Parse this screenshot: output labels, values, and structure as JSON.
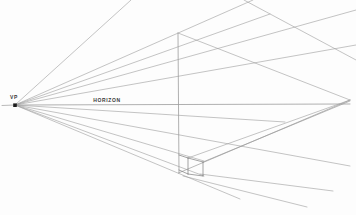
{
  "figure": {
    "background": "#fdfdfd",
    "line_color": "#9c9c9c",
    "box_line_color": "#7d7d7d",
    "text_color": "#3a3a3a",
    "marker_color": "#1c1c1c",
    "width": 356,
    "height": 215,
    "labels": {
      "vp": "VP",
      "horizon": "HORIZON"
    },
    "vanishing_point_marker": {
      "x": 13.2,
      "y": 103.4,
      "size": 3.6
    },
    "left_vp": {
      "x": 15,
      "y": 105
    },
    "right_vp": {
      "x": 350,
      "y": 100
    },
    "lines": [
      {
        "x1": 2,
        "y1": 105.5,
        "x2": 15,
        "y2": 105,
        "w": 0.7
      },
      {
        "x1": 15,
        "y1": 105,
        "x2": 350,
        "y2": 104,
        "w": 0.8
      },
      {
        "x1": 15,
        "y1": 105,
        "x2": 131,
        "y2": 0,
        "w": 0.6
      },
      {
        "x1": 15,
        "y1": 105,
        "x2": 253,
        "y2": 0,
        "w": 0.6
      },
      {
        "x1": 15,
        "y1": 105,
        "x2": 270,
        "y2": 14,
        "w": 0.6
      },
      {
        "x1": 15,
        "y1": 105,
        "x2": 356,
        "y2": 10,
        "w": 0.6
      },
      {
        "x1": 15,
        "y1": 105,
        "x2": 356,
        "y2": 45,
        "w": 0.6
      },
      {
        "x1": 15,
        "y1": 105,
        "x2": 285,
        "y2": 122,
        "w": 0.6
      },
      {
        "x1": 15,
        "y1": 105,
        "x2": 350,
        "y2": 166,
        "w": 0.6
      },
      {
        "x1": 15,
        "y1": 105,
        "x2": 204,
        "y2": 161,
        "w": 0.6
      },
      {
        "x1": 15,
        "y1": 105,
        "x2": 204,
        "y2": 176,
        "w": 0.6
      },
      {
        "x1": 15,
        "y1": 105,
        "x2": 240,
        "y2": 199,
        "w": 0.6
      },
      {
        "x1": 178,
        "y1": 33,
        "x2": 179,
        "y2": 173,
        "w": 0.8
      },
      {
        "x1": 178,
        "y1": 33,
        "x2": 350,
        "y2": 100,
        "w": 0.6
      },
      {
        "x1": 178.5,
        "y1": 173,
        "x2": 350,
        "y2": 100,
        "w": 0.7
      },
      {
        "x1": 188,
        "y1": 158,
        "x2": 350,
        "y2": 100,
        "w": 0.6
      },
      {
        "x1": 203,
        "y1": 162,
        "x2": 350,
        "y2": 101,
        "w": 0.7
      },
      {
        "x1": 244,
        "y1": 0,
        "x2": 356,
        "y2": 60,
        "w": 0.6
      },
      {
        "x1": 200,
        "y1": 174,
        "x2": 333,
        "y2": 191,
        "w": 0.6
      },
      {
        "x1": 183,
        "y1": 176,
        "x2": 307,
        "y2": 207,
        "w": 0.6
      }
    ],
    "small_box_edges": [
      {
        "x1": 179,
        "y1": 155,
        "x2": 188,
        "y2": 158
      },
      {
        "x1": 188,
        "y1": 158,
        "x2": 203,
        "y2": 162
      },
      {
        "x1": 188,
        "y1": 158,
        "x2": 188,
        "y2": 174
      },
      {
        "x1": 203,
        "y1": 162,
        "x2": 203,
        "y2": 176
      },
      {
        "x1": 188,
        "y1": 174,
        "x2": 203,
        "y2": 176
      },
      {
        "x1": 179,
        "y1": 170,
        "x2": 188,
        "y2": 174
      }
    ]
  }
}
